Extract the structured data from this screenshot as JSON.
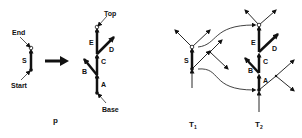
{
  "panels": {
    "p": {
      "caption": "p",
      "segment": {
        "label": "S",
        "start_label": "Start",
        "end_label": "End"
      },
      "tree": {
        "top_label": "Top",
        "base_label": "Base",
        "edges": [
          "A",
          "B",
          "C",
          "D",
          "E"
        ]
      }
    },
    "t1": {
      "caption": "T",
      "subscript": "1",
      "segment_label": "S"
    },
    "t2": {
      "caption": "T",
      "subscript": "2",
      "edges": [
        "A",
        "B",
        "C",
        "D",
        "E"
      ]
    }
  },
  "colors": {
    "stroke": "#111111",
    "background": "#ffffff"
  }
}
